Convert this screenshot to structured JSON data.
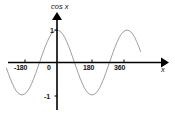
{
  "figure": {
    "name": "cosine-function-graph",
    "background_color": "#ffffff",
    "width": 175,
    "height": 114
  },
  "axes": {
    "y_axis_label": "cos",
    "y_axis_variable": "x",
    "x_axis_label": "x",
    "axis_color": "#000000",
    "y_tick_labels": [
      "1",
      "-1"
    ],
    "x_tick_labels": [
      "-180",
      "0",
      "180",
      "360"
    ]
  },
  "chart_data": {
    "type": "line",
    "title": "cos x",
    "xlabel": "x",
    "ylabel": "cos x",
    "xlim": [
      -260,
      430
    ],
    "ylim": [
      -1.25,
      1.25
    ],
    "grid": false,
    "legend": null,
    "curve_color": "#8c8c8c",
    "function": "y = cos(x)",
    "period_degrees": 360,
    "amplitude": 1,
    "x_ticks": [
      -180,
      0,
      180,
      360
    ],
    "x_tick_labels": [
      "-180",
      "0",
      "180",
      "360"
    ],
    "y_ticks": [
      1,
      -1
    ],
    "y_tick_labels": [
      "1",
      "-1"
    ],
    "series": [
      {
        "name": "cos x",
        "x": [
          -260,
          -250,
          -240,
          -230,
          -220,
          -210,
          -200,
          -190,
          -180,
          -170,
          -160,
          -150,
          -140,
          -130,
          -120,
          -110,
          -100,
          -90,
          -80,
          -70,
          -60,
          -50,
          -40,
          -30,
          -20,
          -10,
          0,
          10,
          20,
          30,
          40,
          50,
          60,
          70,
          80,
          90,
          100,
          110,
          120,
          130,
          140,
          150,
          160,
          170,
          180,
          190,
          200,
          210,
          220,
          230,
          240,
          250,
          260,
          270,
          280,
          290,
          300,
          310,
          320,
          330,
          340,
          350,
          360,
          370,
          380,
          390,
          400,
          410,
          420,
          430
        ],
        "y": [
          -0.17,
          -0.34,
          -0.5,
          -0.64,
          -0.77,
          -0.87,
          -0.94,
          -0.98,
          -1.0,
          -0.98,
          -0.94,
          -0.87,
          -0.77,
          -0.64,
          -0.5,
          -0.34,
          -0.17,
          0.0,
          0.17,
          0.34,
          0.5,
          0.64,
          0.77,
          0.87,
          0.94,
          0.98,
          1.0,
          0.98,
          0.94,
          0.87,
          0.77,
          0.64,
          0.5,
          0.34,
          0.17,
          0.0,
          -0.17,
          -0.34,
          -0.5,
          -0.64,
          -0.77,
          -0.87,
          -0.94,
          -0.98,
          -1.0,
          -0.98,
          -0.94,
          -0.87,
          -0.77,
          -0.64,
          -0.5,
          -0.34,
          -0.17,
          0.0,
          0.17,
          0.34,
          0.5,
          0.64,
          0.77,
          0.87,
          0.94,
          0.98,
          1.0,
          0.98,
          0.94,
          0.87,
          0.77,
          0.64,
          0.5,
          0.34
        ]
      }
    ],
    "key_points": {
      "maxima_x": [
        0,
        360
      ],
      "minima_x": [
        -180,
        180
      ],
      "zeros_x": [
        -90,
        90,
        270
      ]
    }
  }
}
